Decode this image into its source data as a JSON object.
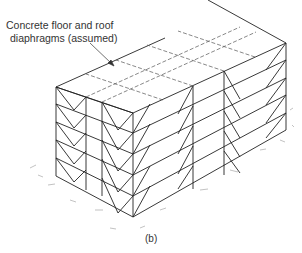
{
  "figure": {
    "annotation": {
      "line1": "Concrete floor and roof",
      "line2": "diaphragms (assumed)"
    },
    "caption": "(b)",
    "stories": 5,
    "colors": {
      "line": "#222222",
      "dashed": "#555555",
      "text": "#333333",
      "background": "#ffffff"
    }
  }
}
